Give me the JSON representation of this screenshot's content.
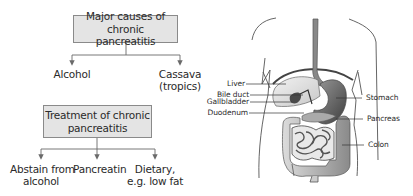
{
  "causes": {
    "title_line1": "Major causes of chronic",
    "title_line2": "pancreatitis",
    "items": [
      {
        "line1": "Alcohol",
        "line2": ""
      },
      {
        "line1": "Cassava",
        "line2": "(tropics)"
      }
    ]
  },
  "treatment": {
    "title_line1": "Treatment of chronic",
    "title_line2": "pancreatitis",
    "items": [
      {
        "line1": "Abstain from",
        "line2": "alcohol"
      },
      {
        "line1": "Pancreatin",
        "line2": ""
      },
      {
        "line1": "Dietary,",
        "line2": "e.g. low fat"
      }
    ]
  },
  "anatomy": {
    "labels_left": [
      "Liver",
      "Bile duct",
      "Gallbladder",
      "Duodenum"
    ],
    "labels_right": [
      "Stomach",
      "Pancreas",
      "Colon"
    ]
  },
  "colors": {
    "box_fill": "#e4e4e4",
    "box_border": "#8a8a8a",
    "line": "#6a6a6a",
    "organ_dark": "#555555"
  }
}
